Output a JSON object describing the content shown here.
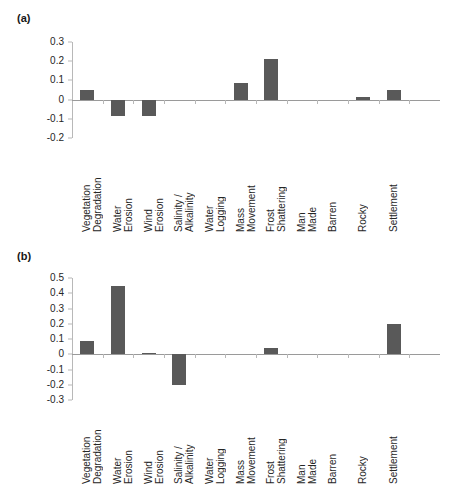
{
  "figure": {
    "panels": [
      {
        "tag": "(a)"
      },
      {
        "tag": "(b)"
      }
    ]
  },
  "chart_data": [
    {
      "id": "panel-a",
      "type": "bar",
      "title": "(a)",
      "xlabel": "",
      "ylabel": "",
      "ylim": [
        -0.2,
        0.3
      ],
      "yticks": [
        "0.3",
        "0.2",
        "0.1",
        "0",
        "-0.1",
        "-0.2"
      ],
      "ytick_values": [
        0.3,
        0.2,
        0.1,
        0,
        -0.1,
        -0.2
      ],
      "grid": false,
      "legend": "none",
      "categories": [
        "Vegetation Degradation",
        "Water Erosion",
        "Wind Erosion",
        "Salinity / Alkalinity",
        "Water Logging",
        "Mass Movement",
        "Frost Shattering",
        "Man Made",
        "Barren",
        "Rocky",
        "Settlement"
      ],
      "values": [
        0.05,
        -0.085,
        -0.085,
        0.0,
        0.0,
        0.085,
        0.21,
        0.0,
        0.0,
        0.015,
        0.05
      ],
      "bar_color": "#595959"
    },
    {
      "id": "panel-b",
      "type": "bar",
      "title": "(b)",
      "xlabel": "",
      "ylabel": "",
      "ylim": [
        -0.3,
        0.5
      ],
      "yticks": [
        "0.5",
        "0.4",
        "0.3",
        "0.2",
        "0.1",
        "0",
        "-0.1",
        "-0.2",
        "-0.3"
      ],
      "ytick_values": [
        0.5,
        0.4,
        0.3,
        0.2,
        0.1,
        0,
        -0.1,
        -0.2,
        -0.3
      ],
      "grid": false,
      "legend": "none",
      "categories": [
        "Vegetation Degradation",
        "Water Erosion",
        "Wind Erosion",
        "Salinity / Alkalinity",
        "Water Logging",
        "Mass Movement",
        "Frost Shattering",
        "Man Made",
        "Barren",
        "Rocky",
        "Settlement"
      ],
      "values": [
        0.09,
        0.445,
        0.005,
        -0.2,
        0.0,
        0.0,
        0.04,
        0.0,
        0.0,
        0.0,
        0.2
      ],
      "bar_color": "#595959"
    }
  ]
}
